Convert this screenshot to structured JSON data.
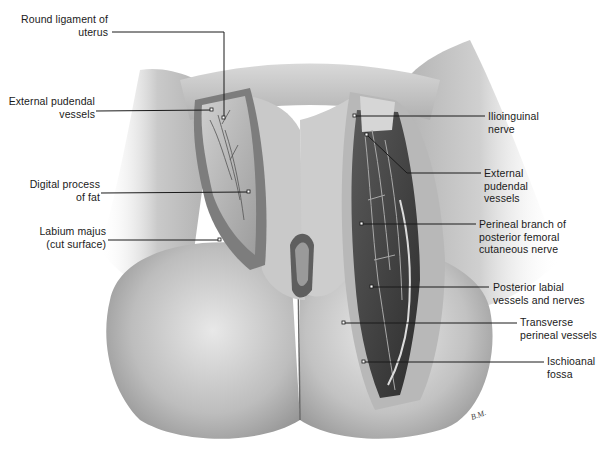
{
  "figure": {
    "type": "labeled anatomical illustration (schematic)",
    "signature": "B.M."
  },
  "labels_left": [
    {
      "id": "round-ligament",
      "text": "Round ligament of\nuterus"
    },
    {
      "id": "external-pudendal-left",
      "text": "External pudendal\nvessels"
    },
    {
      "id": "digital-process",
      "text": "Digital process\nof fat"
    },
    {
      "id": "labium-majus",
      "text": "Labium majus\n(cut surface)"
    }
  ],
  "labels_right": [
    {
      "id": "ilioinguinal",
      "text": "Ilioinguinal\nnerve"
    },
    {
      "id": "external-pudendal-right",
      "text": "External\npudendal\nvessels"
    },
    {
      "id": "perineal-branch",
      "text": "Perineal branch of\nposterior femoral\ncutaneous nerve"
    },
    {
      "id": "posterior-labial",
      "text": "Posterior labial\nvessels and nerves"
    },
    {
      "id": "transverse-perineal",
      "text": "Transverse\nperineal vessels"
    },
    {
      "id": "ischioanal",
      "text": "Ischioanal\nfossa"
    }
  ]
}
